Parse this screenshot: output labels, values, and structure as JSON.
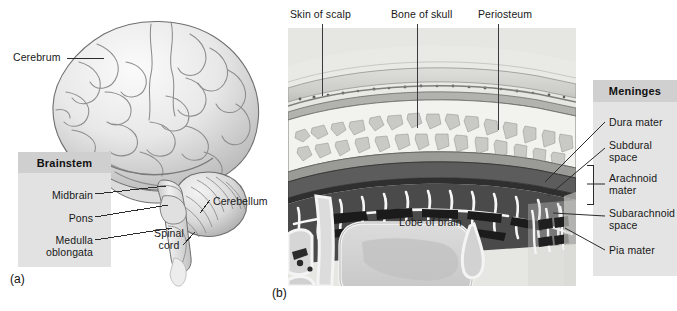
{
  "figure": {
    "panel_a": {
      "letter": "(a)",
      "title_box": {
        "header": "Brainstem",
        "items": [
          {
            "label": "Midbrain"
          },
          {
            "label": "Pons"
          },
          {
            "label": "Medulla\noblongata"
          }
        ]
      },
      "callouts": [
        {
          "name": "cerebrum",
          "label": "Cerebrum"
        },
        {
          "name": "cerebellum",
          "label": "Cerebellum"
        },
        {
          "name": "spinal-cord",
          "label": "Spinal\ncord"
        }
      ]
    },
    "panel_b": {
      "letter": "(b)",
      "top_callouts": [
        {
          "name": "skin-of-scalp",
          "label": "Skin of scalp"
        },
        {
          "name": "bone-of-skull",
          "label": "Bone of skull"
        },
        {
          "name": "periosteum",
          "label": "Periosteum"
        }
      ],
      "inner_label": "Lobe of brain",
      "title_box": {
        "header": "Meninges",
        "items": [
          {
            "label": "Dura mater"
          },
          {
            "label": "Subdural\nspace"
          },
          {
            "label": "Arachnoid\nmater"
          },
          {
            "label": "Subarachnoid\nspace"
          },
          {
            "label": "Pia mater"
          }
        ]
      }
    }
  },
  "colors": {
    "background": "#ffffff",
    "panel_fill": "#e4e4e4",
    "panel_header_fill": "#cfcfcf",
    "leader_line": "#2b2b2b",
    "text": "#181818",
    "brain_light": "#f2f2f2",
    "brain_mid": "#d2d2d2",
    "brain_dark": "#9a9a9a",
    "bone_fill": "#efefec",
    "dura_fill": "#6f6f6f",
    "brain_lobe": "#d5d5d5"
  }
}
